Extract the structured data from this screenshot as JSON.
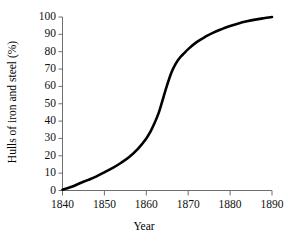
{
  "top_remnant": "· · ·",
  "chart_data": {
    "type": "line",
    "title": "",
    "subtitle": "",
    "xlabel": "Year",
    "ylabel": "Hulls of iron and steel (%)",
    "xlim": [
      1840,
      1890
    ],
    "ylim": [
      0,
      100
    ],
    "xticks": [
      1840,
      1850,
      1860,
      1870,
      1880,
      1890
    ],
    "xtick_labels": [
      "1840",
      "1850",
      "1860",
      "1870",
      "1880",
      "1890"
    ],
    "yticks": [
      0,
      10,
      20,
      30,
      40,
      50,
      60,
      70,
      80,
      90,
      100
    ],
    "ytick_labels": [
      "0",
      "10",
      "20",
      "30",
      "40",
      "50",
      "60",
      "70",
      "80",
      "90",
      "100"
    ],
    "grid": false,
    "legend": false,
    "legend_position": "none",
    "line_color": "#000000",
    "line_width_px": 2.6,
    "axis_color": "#6e6e6e",
    "annotations": [],
    "series": [
      {
        "name": "Hulls of iron and steel",
        "x": [
          1840,
          1842,
          1844,
          1846,
          1848,
          1850,
          1852,
          1854,
          1856,
          1858,
          1860,
          1861,
          1862,
          1863,
          1864,
          1865,
          1866,
          1867,
          1868,
          1869,
          1870,
          1872,
          1874,
          1876,
          1878,
          1880,
          1882,
          1884,
          1886,
          1888,
          1890
        ],
        "values": [
          0.5,
          2,
          4,
          6,
          8,
          10.5,
          13,
          16,
          19.5,
          24,
          30,
          34,
          39,
          45,
          53,
          61,
          68,
          73,
          76.5,
          79,
          81.5,
          85.5,
          88.5,
          91,
          93,
          94.8,
          96.3,
          97.5,
          98.5,
          99.3,
          100
        ]
      }
    ]
  }
}
